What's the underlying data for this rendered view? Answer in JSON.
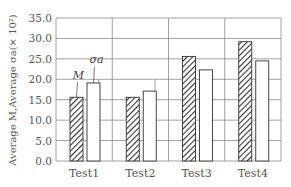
{
  "chart_data": {
    "type": "bar",
    "title": "",
    "xlabel": "",
    "ylabel": "Average M,Average σa(× 10²)",
    "categories": [
      "Test1",
      "Test2",
      "Test3",
      "Test4"
    ],
    "series": [
      {
        "name": "M",
        "pattern": "hatched",
        "values": [
          15.6,
          15.6,
          25.6,
          29.2
        ]
      },
      {
        "name": "σa",
        "pattern": "open",
        "values": [
          19.1,
          17.1,
          22.3,
          24.5
        ]
      }
    ],
    "ylim": [
      0,
      35
    ],
    "yticks": [
      "0.0",
      "5.0",
      "10.0",
      "15.0",
      "20.0",
      "25.0",
      "30.0",
      "35.0"
    ],
    "grid": true,
    "annotations": [
      {
        "text": "M",
        "target": "Test1 M bar"
      },
      {
        "text": "σa",
        "target": "Test1 σa bar"
      }
    ]
  }
}
